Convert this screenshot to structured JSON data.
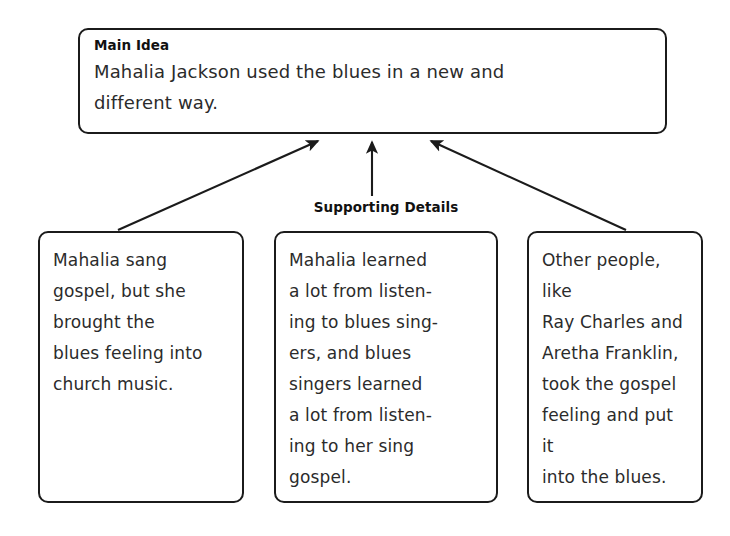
{
  "document": {
    "type": "graphic-organizer",
    "title": "Main Idea and Supporting Details",
    "background_color": "#ffffff",
    "line_color": "#1b1b1b",
    "text_color": "#2b2b2b"
  },
  "main_idea": {
    "heading": "Main Idea",
    "text": "Mahalia Jackson used the blues in a new and\ndifferent way."
  },
  "supporting_details": {
    "label": "Supporting Details",
    "boxes": [
      {
        "id": "detail-1",
        "text": "Mahalia sang\ngospel, but she\nbrought the\nblues feeling into\nchurch music."
      },
      {
        "id": "detail-2",
        "text": "Mahalia learned\na lot from listen-\ning to blues sing-\ners, and blues\nsingers learned\na lot from listen-\ning to her sing\ngospel."
      },
      {
        "id": "detail-3",
        "text": "Other people, like\nRay Charles and\nAretha Franklin,\ntook the gospel\nfeeling and put it\ninto the blues."
      }
    ]
  },
  "connectors": [
    {
      "name": "arrow-detail-1-to-main",
      "from": "detail-1",
      "to": "main-idea",
      "direction": "up-right"
    },
    {
      "name": "arrow-detail-2-to-main",
      "from": "detail-2",
      "to": "main-idea",
      "direction": "up"
    },
    {
      "name": "arrow-detail-3-to-main",
      "from": "detail-3",
      "to": "main-idea",
      "direction": "up-left"
    }
  ],
  "footer": {
    "text": ""
  }
}
